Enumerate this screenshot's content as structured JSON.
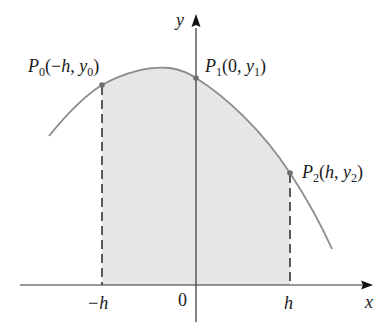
{
  "figure": {
    "colors": {
      "curve": "#8c8c8c",
      "fill": "#e6e6e6",
      "axes": "#333333",
      "points": "#6e6e6e",
      "text": "#1a1a1a"
    },
    "axes": {
      "x_label": "x",
      "y_label": "y",
      "origin_label": "0"
    },
    "ticks": {
      "neg_h": "−h",
      "h": "h"
    },
    "points": [
      {
        "name": "P",
        "sub": "0",
        "coord_open": "(−",
        "x": "h",
        "sep": ", ",
        "y": "y",
        "ysub": "0",
        "close": ")"
      },
      {
        "name": "P",
        "sub": "1",
        "coord_open": "(0, ",
        "y": "y",
        "ysub": "1",
        "close": ")"
      },
      {
        "name": "P",
        "sub": "2",
        "coord_open": "(",
        "x": "h",
        "sep": ", ",
        "y": "y",
        "ysub": "2",
        "close": ")"
      }
    ]
  }
}
